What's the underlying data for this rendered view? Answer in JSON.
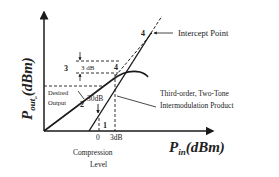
{
  "diagram": {
    "x_axis": {
      "label_main": "P",
      "label_sub": "in",
      "label_unit": "(dBm)"
    },
    "y_axis": {
      "label_main": "P",
      "label_sub": "out",
      "label_subsub": "o",
      "label_unit": "(dBm)"
    },
    "annotations": {
      "intercept_point": "Intercept Point",
      "imd_line1": "Third-order, Two-Tone",
      "imd_line2": "Intermodulation Product",
      "compression_line1": "Compression",
      "compression_line2": "Level",
      "desired_line1": "Desired",
      "desired_line2": "Output",
      "three_db": "3 dB",
      "thirty_db": "30dB",
      "tick_zero": "0",
      "tick_3db": "3dB"
    },
    "markers": {
      "m1": "1",
      "m2": "2",
      "m3": "3",
      "m4a": "4",
      "m4b": "4"
    },
    "colors": {
      "line": "#1a1a1a",
      "text": "#222222",
      "background": "#ffffff"
    }
  }
}
